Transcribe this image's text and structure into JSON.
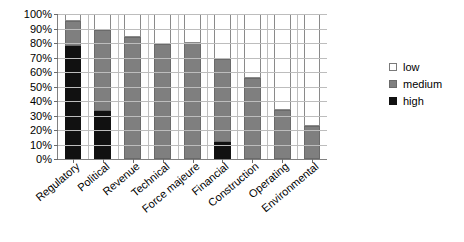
{
  "chart_data": {
    "type": "bar",
    "stacked": true,
    "title": "",
    "xlabel": "",
    "ylabel": "",
    "ylim": [
      0,
      100
    ],
    "ytick_labels": [
      "100%",
      "90%",
      "80%",
      "70%",
      "60%",
      "50%",
      "40%",
      "30%",
      "20%",
      "10%",
      "0%"
    ],
    "ytick_values": [
      100,
      90,
      80,
      70,
      60,
      50,
      40,
      30,
      20,
      10,
      0
    ],
    "grid": true,
    "grid_axis": "both",
    "legend_position": "right",
    "categories": [
      "Regulatory",
      "Political",
      "Revenue",
      "Technical",
      "Force majeure",
      "Financial",
      "Construction",
      "Operating",
      "Environmental"
    ],
    "series": [
      {
        "name": "high",
        "color": "#111111",
        "values": [
          78,
          33,
          0,
          0,
          0,
          12,
          0,
          0,
          0
        ]
      },
      {
        "name": "medium",
        "color": "#7f7f7f",
        "values": [
          17,
          56,
          84,
          79,
          80,
          57,
          56,
          34,
          23
        ]
      },
      {
        "name": "low",
        "color": "#ffffff",
        "values": [
          5,
          11,
          16,
          21,
          20,
          31,
          44,
          66,
          77
        ]
      }
    ],
    "totals": [
      100,
      100,
      100,
      100,
      100,
      100,
      100,
      100,
      100
    ]
  },
  "legend": {
    "items": [
      {
        "label": "low",
        "swatch": "low"
      },
      {
        "label": "medium",
        "swatch": "medium"
      },
      {
        "label": "high",
        "swatch": "high"
      }
    ]
  },
  "colors": {
    "high": "#111111",
    "medium": "#7f7f7f",
    "low": "#ffffff",
    "gridline": "#bdbdbd",
    "axis": "#808080",
    "text": "#000000",
    "background": "#ffffff"
  }
}
